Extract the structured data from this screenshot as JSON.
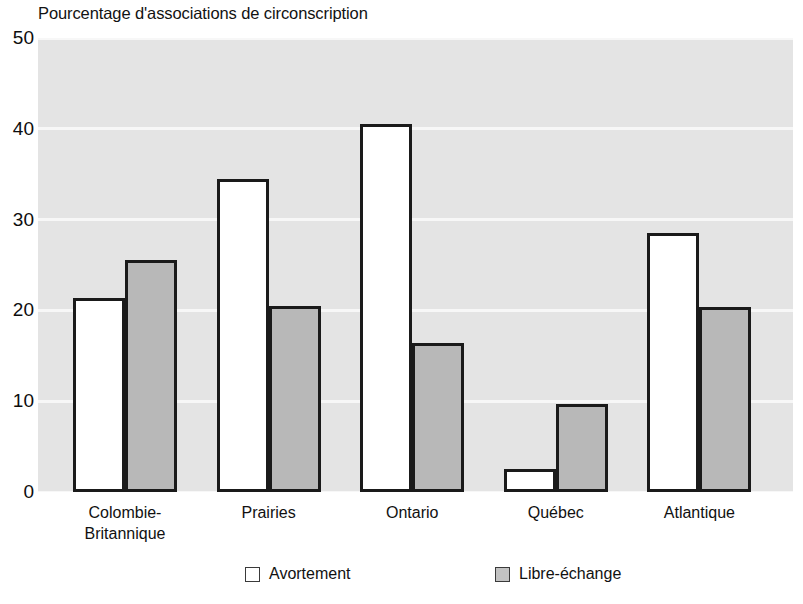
{
  "chart_data": {
    "type": "bar",
    "title": "Pourcentage d'associations de circonscription",
    "xlabel": "",
    "ylabel": "",
    "ylim": [
      0,
      50
    ],
    "yticks": [
      0,
      10,
      20,
      30,
      40,
      50
    ],
    "grid": true,
    "legend_position": "bottom",
    "categories": [
      "Colombie-\nBritannique",
      "Prairies",
      "Ontario",
      "Québec",
      "Atlantique"
    ],
    "series": [
      {
        "name": "Avortement",
        "color": "#ffffff",
        "values": [
          21.4,
          34.5,
          40.5,
          2.5,
          28.5
        ]
      },
      {
        "name": "Libre-échange",
        "color": "#b8b8b8",
        "values": [
          25.5,
          20.5,
          16.4,
          9.7,
          20.4
        ]
      }
    ]
  },
  "axis": {
    "ytick_labels": [
      "50",
      "40",
      "30",
      "20",
      "10",
      "0"
    ]
  },
  "xlabels": [
    {
      "line1": "Colombie-",
      "line2": "Britannique"
    },
    {
      "line1": "Prairies",
      "line2": ""
    },
    {
      "line1": "Ontario",
      "line2": ""
    },
    {
      "line1": "Québec",
      "line2": ""
    },
    {
      "line1": "Atlantique",
      "line2": ""
    }
  ],
  "legend": {
    "items": [
      {
        "label": "Avortement",
        "swatch": "white-square-icon"
      },
      {
        "label": "Libre-échange",
        "swatch": "gray-square-icon"
      }
    ]
  },
  "colors": {
    "plot_background": "#e4e4e4",
    "gridline": "#f7f7f7",
    "bar_outline": "#1a1a1a",
    "bar_fill_series1": "#ffffff",
    "bar_fill_series2": "#b8b8b8"
  }
}
